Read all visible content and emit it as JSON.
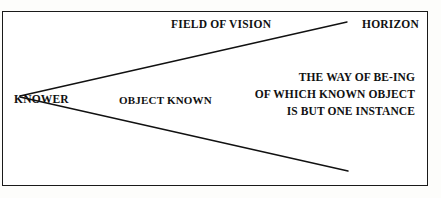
{
  "figure": {
    "kind": "line-diagram",
    "border_color": "#1a1a1a",
    "background_color": "#ffffff",
    "line_color": "#111111",
    "labels": {
      "field_of_vision": "FIELD OF VISION",
      "horizon": "HORIZON",
      "knower": "KNOWER",
      "object_known": "OBJECT KNOWN"
    },
    "right_block": {
      "line1": "THE WAY OF BE-ING",
      "line2": "OF WHICH  KNOWN OBJECT",
      "line3": "IS BUT ONE INSTANCE"
    }
  }
}
